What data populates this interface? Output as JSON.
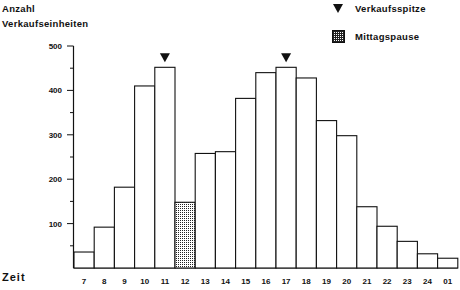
{
  "chart_data": {
    "type": "bar",
    "title": "",
    "ylabel": "Anzahl Verkaufseinheiten",
    "xlabel": "Zeit",
    "ylim": [
      0,
      500
    ],
    "yticks": [
      100,
      200,
      300,
      400,
      500
    ],
    "categories": [
      "7",
      "8",
      "9",
      "10",
      "11",
      "12",
      "13",
      "14",
      "15",
      "16",
      "17",
      "18",
      "19",
      "20",
      "21",
      "22",
      "23",
      "24",
      "01"
    ],
    "values": [
      36,
      92,
      182,
      410,
      452,
      148,
      258,
      262,
      382,
      440,
      452,
      428,
      332,
      298,
      138,
      94,
      60,
      32,
      22
    ],
    "peaks": [
      "11",
      "17"
    ],
    "lunch_break": [
      "12"
    ],
    "legend": [
      {
        "symbol": "triangle-down",
        "label": "Verkaufsspitze"
      },
      {
        "symbol": "hatched-box",
        "label": "Mittagspause"
      }
    ],
    "grid": false
  },
  "ytitle_line1": "Anzahl",
  "ytitle_line2": "Verkaufseinheiten",
  "xtitle": "Zeit",
  "legend_peak": "Verkaufsspitze",
  "legend_lunch": "Mittagspause"
}
